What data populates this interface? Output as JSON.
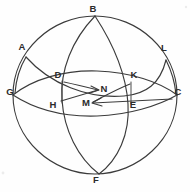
{
  "figure": {
    "background_color": "#fefefe",
    "stroke_color": "#3b3b3b",
    "label_color": "#2b2b2b",
    "width": 190,
    "height": 192,
    "labels": [
      {
        "id": "B",
        "text": "B",
        "x": 93,
        "y": 12,
        "anchor": "middle"
      },
      {
        "id": "A",
        "text": "A",
        "x": 22,
        "y": 50,
        "anchor": "middle"
      },
      {
        "id": "L",
        "text": "L",
        "x": 164,
        "y": 51,
        "anchor": "middle"
      },
      {
        "id": "D",
        "text": "D",
        "x": 58,
        "y": 78,
        "anchor": "middle"
      },
      {
        "id": "K",
        "text": "K",
        "x": 134,
        "y": 78,
        "anchor": "middle"
      },
      {
        "id": "N",
        "text": "N",
        "x": 104,
        "y": 92,
        "anchor": "middle"
      },
      {
        "id": "G",
        "text": "G",
        "x": 10,
        "y": 95,
        "anchor": "middle"
      },
      {
        "id": "C",
        "text": "C",
        "x": 178,
        "y": 95,
        "anchor": "middle"
      },
      {
        "id": "H",
        "text": "H",
        "x": 53,
        "y": 108,
        "anchor": "middle"
      },
      {
        "id": "M",
        "text": "M",
        "x": 86,
        "y": 106,
        "anchor": "middle"
      },
      {
        "id": "E",
        "text": "E",
        "x": 133,
        "y": 108,
        "anchor": "middle"
      },
      {
        "id": "F",
        "text": "F",
        "x": 96,
        "y": 183,
        "anchor": "middle"
      }
    ],
    "curves": [
      {
        "id": "outer-sphere-circle",
        "name": "sphere-outline",
        "d": "M 95 16 C 138 16 177 51 177 95 C 177 139 138 174 95 174 C 52 174 13 139 13 95 C 13 51 52 16 95 16 Z"
      },
      {
        "id": "meridian-b-f-front",
        "name": "meridian-front-arc",
        "d": "M 95 16 C 72 40 60 70 62 100 C 64 130 78 158 99 174"
      },
      {
        "id": "meridian-b-f-back",
        "name": "meridian-back-arc",
        "d": "M 95 16 C 112 42 126 72 128 104 C 130 134 118 160 99 174"
      },
      {
        "id": "equator-g-c-front",
        "name": "equator-front-arc",
        "d": "M 13 95 C 36 110 66 117 97 116 C 128 115 158 106 177 95"
      },
      {
        "id": "equator-g-c-back",
        "name": "equator-back-arc",
        "d": "M 13 95 C 33 79 64 70 97 71 C 130 72 160 82 177 95"
      },
      {
        "id": "oblique-a-l-arc",
        "name": "oblique-great-circle-arc",
        "d": "M 26 57 C 50 84 88 99 124 96 C 146 94 160 84 166 60"
      },
      {
        "id": "oblique-a-g-edge",
        "name": "oblique-left-edge",
        "d": "M 26 57 C 20 67 16 80 15 93"
      },
      {
        "id": "oblique-l-c-edge",
        "name": "oblique-right-edge",
        "d": "M 166 60 C 172 72 175 84 176 94"
      },
      {
        "id": "segment-d-h",
        "name": "vertical-chord-dh",
        "d": "M 62 81 L 62 103"
      },
      {
        "id": "segment-k-e",
        "name": "vertical-chord-ke",
        "d": "M 131 82 L 131 104"
      },
      {
        "id": "ray-h-to-n",
        "name": "ray-toward-n",
        "d": "M 61 101 L 98 90"
      },
      {
        "id": "ray-d-to-n",
        "name": "ray-d-toward-n",
        "d": "M 64 82 C 78 85 90 88 98 90"
      },
      {
        "id": "ray-c-to-m",
        "name": "ray-toward-m",
        "d": "M 172 99 L 93 103"
      },
      {
        "id": "ray-k-to-m",
        "name": "ray-k-toward-m",
        "d": "M 130 84 C 115 90 103 97 93 102"
      }
    ],
    "arrowheads": [
      {
        "id": "arrow-n",
        "name": "arrowhead-pointing-to-n",
        "d": "M 91 86 L 99 90 L 90 93"
      },
      {
        "id": "arrow-m",
        "name": "arrowhead-pointing-to-m",
        "d": "M 101 98 L 92 103 L 102 106"
      }
    ]
  }
}
